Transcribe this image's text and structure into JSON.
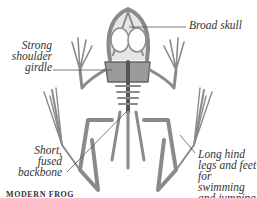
{
  "diagram": {
    "labels": [
      {
        "id": "broad-skull",
        "text": "Broad skull"
      },
      {
        "id": "shoulder-girdle",
        "lines": [
          "Strong",
          "shoulder",
          "girdle"
        ]
      },
      {
        "id": "backbone",
        "lines": [
          "Short,",
          "fused",
          "backbone"
        ]
      },
      {
        "id": "hind-legs",
        "lines": [
          "Long hind",
          "legs and feet",
          "for swimming",
          "and jumping"
        ]
      }
    ],
    "caption": "MODERN FROG",
    "colors": {
      "bone": "#8a8a8a",
      "bone_dark": "#555555",
      "label_text": "#333333",
      "leader_line": "#444444",
      "background": "#ffffff"
    }
  }
}
